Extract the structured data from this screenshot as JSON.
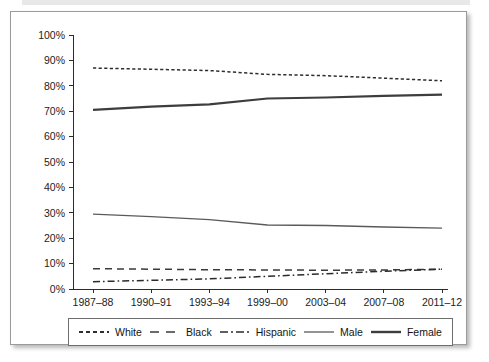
{
  "figure": {
    "frame_border_color": "#9a9a9a",
    "background": "#ffffff"
  },
  "legend": {
    "position": "bottom",
    "items": [
      {
        "label": "White",
        "style": "fine-dashed",
        "color": "#2e2e2e"
      },
      {
        "label": "Black",
        "style": "long-dashed",
        "color": "#3a3a3a"
      },
      {
        "label": "Hispanic",
        "style": "dash-dot",
        "color": "#2b2b2b"
      },
      {
        "label": "Male",
        "style": "thin-solid",
        "color": "#5a5a5a"
      },
      {
        "label": "Female",
        "style": "thick-solid",
        "color": "#3d3d3d"
      }
    ]
  },
  "chart_data": {
    "type": "line",
    "title": "",
    "subtitle": "",
    "xlabel": "",
    "ylabel": "",
    "categories": [
      "1987–88",
      "1990–91",
      "1993–94",
      "1999–00",
      "2003–04",
      "2007–08",
      "2011–12"
    ],
    "ytick_labels": [
      "0%",
      "10%",
      "20%",
      "30%",
      "40%",
      "50%",
      "60%",
      "70%",
      "80%",
      "90%",
      "100%"
    ],
    "ytick_values": [
      0,
      10,
      20,
      30,
      40,
      50,
      60,
      70,
      80,
      90,
      100
    ],
    "ylim": [
      0,
      100
    ],
    "grid": false,
    "legend_position": "bottom",
    "series": [
      {
        "name": "White",
        "values": [
          87.0,
          86.5,
          86.0,
          84.5,
          84.0,
          83.0,
          82.0
        ]
      },
      {
        "name": "Black",
        "values": [
          8.0,
          7.8,
          7.6,
          7.5,
          7.4,
          7.5,
          7.8
        ]
      },
      {
        "name": "Hispanic",
        "values": [
          2.9,
          3.4,
          4.0,
          5.0,
          6.0,
          7.0,
          7.8
        ]
      },
      {
        "name": "Male",
        "values": [
          29.5,
          28.5,
          27.3,
          25.2,
          25.0,
          24.4,
          24.0
        ]
      },
      {
        "name": "Female",
        "values": [
          70.5,
          71.8,
          72.7,
          75.0,
          75.4,
          76.0,
          76.5
        ]
      }
    ]
  }
}
